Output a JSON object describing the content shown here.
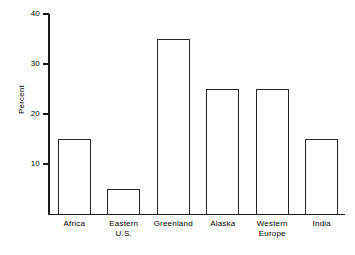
{
  "chart_data": {
    "type": "bar",
    "title": "",
    "xlabel": "",
    "ylabel": "Percent",
    "ylim": [
      0,
      43
    ],
    "yticks": [
      10,
      20,
      30,
      40
    ],
    "ytick_labels": [
      "10",
      "20",
      "30",
      "40"
    ],
    "grid": false,
    "legend": null,
    "bar_style": {
      "fill": "#ffffff",
      "edge_color": "#262626",
      "edge_width_px": 1.5
    },
    "axis_color": "#1a1a1a",
    "background": "#ffffff",
    "categories": [
      "Africa",
      "Eastern U.S.",
      "Greenland",
      "Alaska",
      "Western Europe",
      "India"
    ],
    "category_label_lines": [
      [
        "Africa"
      ],
      [
        "Eastern",
        "U.S."
      ],
      [
        "Greenland"
      ],
      [
        "Alaska"
      ],
      [
        "Western",
        "Europe"
      ],
      [
        "India"
      ]
    ],
    "values": [
      15,
      5,
      35,
      25,
      25,
      15
    ]
  }
}
